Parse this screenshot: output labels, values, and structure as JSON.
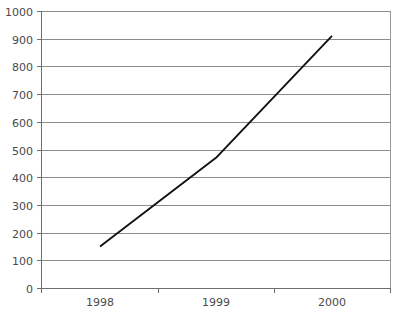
{
  "chart_data": {
    "type": "line",
    "title": "",
    "subtitle": "",
    "xlabel": "",
    "ylabel": "",
    "categories": [
      "1998",
      "1999",
      "2000"
    ],
    "x": [
      "1998",
      "1999",
      "2000"
    ],
    "series": [
      {
        "name": "",
        "values": [
          150,
          470,
          910
        ]
      }
    ],
    "values": [
      150,
      470,
      910
    ],
    "ylim": [
      0,
      1000
    ],
    "y_ticks": [
      0,
      100,
      200,
      300,
      400,
      500,
      600,
      700,
      800,
      900,
      1000
    ],
    "y_tick_labels": [
      "0",
      "100",
      "200",
      "300",
      "400",
      "500",
      "600",
      "700",
      "800",
      "900",
      "1000"
    ],
    "x_tick_labels": [
      "1998",
      "1999",
      "2000"
    ],
    "grid": "horizontal",
    "legend": "none",
    "annotations": [],
    "colors": {
      "line": "#111111",
      "gridline": "#8c8c8c",
      "axis": "#6e6e6e",
      "frame": "#9a9a9a",
      "text": "#4a4a4a",
      "background": "#ffffff"
    }
  },
  "layout": {
    "plot_left": 41,
    "plot_right": 390,
    "plot_top": 11,
    "plot_bottom": 288,
    "x_tick_positions": [
      41,
      158,
      274,
      390
    ],
    "x_label_positions": [
      100,
      216,
      332
    ]
  }
}
